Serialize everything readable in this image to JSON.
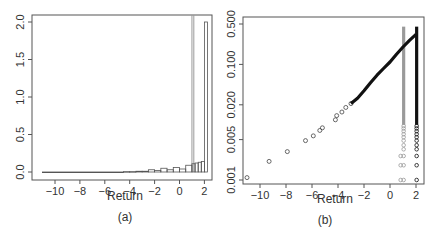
{
  "chart_data": [
    {
      "panel_label": "(a)",
      "type": "bar",
      "title": "",
      "xlabel": "Return",
      "ylabel": "",
      "xlim": [
        -11,
        2.5
      ],
      "ylim": [
        0,
        2.0
      ],
      "x_ticks": [
        -10,
        -8,
        -6,
        -4,
        -2,
        0,
        2
      ],
      "y_ticks": [
        "0.0",
        "0.5",
        "1.0",
        "1.5",
        "2.0"
      ],
      "y_tick_values": [
        0,
        0.5,
        1.0,
        1.5,
        2.0
      ],
      "grid": false,
      "histogram_bins": [
        {
          "x0": -11.0,
          "x1": -4.5,
          "density": 0.0
        },
        {
          "x0": -4.5,
          "x1": -4.0,
          "density": 0.005
        },
        {
          "x0": -4.0,
          "x1": -3.5,
          "density": 0.005
        },
        {
          "x0": -3.5,
          "x1": -3.0,
          "density": 0.01
        },
        {
          "x0": -3.0,
          "x1": -2.5,
          "density": 0.01
        },
        {
          "x0": -2.5,
          "x1": -2.0,
          "density": 0.03
        },
        {
          "x0": -2.0,
          "x1": -1.5,
          "density": 0.02
        },
        {
          "x0": -1.5,
          "x1": -1.0,
          "density": 0.05
        },
        {
          "x0": -1.0,
          "x1": -0.5,
          "density": 0.03
        },
        {
          "x0": -0.5,
          "x1": 0.0,
          "density": 0.06
        },
        {
          "x0": 0.0,
          "x1": 0.5,
          "density": 0.04
        },
        {
          "x0": 0.5,
          "x1": 1.0,
          "density": 0.09
        },
        {
          "x0": 1.0,
          "x1": 1.25,
          "density": 0.11
        },
        {
          "x0": 1.25,
          "x1": 1.5,
          "density": 0.12
        },
        {
          "x0": 1.5,
          "x1": 1.75,
          "density": 0.13
        },
        {
          "x0": 1.75,
          "x1": 2.0,
          "density": 0.14
        },
        {
          "x0": 2.0,
          "x1": 2.25,
          "density": 2.0
        }
      ],
      "gray_spikes_x": [
        1.0,
        1.15
      ]
    },
    {
      "panel_label": "(b)",
      "type": "scatter",
      "title": "",
      "xlabel": "Return",
      "ylabel": "",
      "y_scale": "log",
      "xlim": [
        -11,
        2.5
      ],
      "ylim": [
        0.001,
        0.5
      ],
      "x_ticks": [
        -10,
        -8,
        -6,
        -4,
        -2,
        0,
        2
      ],
      "y_ticks": [
        "0.001",
        "0.005",
        "0.020",
        "0.100",
        "0.500"
      ],
      "y_tick_values": [
        0.001,
        0.005,
        0.02,
        0.1,
        0.5
      ],
      "grid": false,
      "series": [
        {
          "name": "empirical tail (black)",
          "points": [
            {
              "x": -11.0,
              "y": 0.0011
            },
            {
              "x": -9.3,
              "y": 0.0021
            },
            {
              "x": -7.9,
              "y": 0.0031
            },
            {
              "x": -6.5,
              "y": 0.0048
            },
            {
              "x": -5.9,
              "y": 0.0058
            },
            {
              "x": -5.4,
              "y": 0.0072
            },
            {
              "x": -5.2,
              "y": 0.008
            },
            {
              "x": -4.2,
              "y": 0.011
            },
            {
              "x": -4.1,
              "y": 0.013
            },
            {
              "x": -3.7,
              "y": 0.015
            },
            {
              "x": -3.4,
              "y": 0.018
            },
            {
              "x": -3.0,
              "y": 0.021
            },
            {
              "x": -2.5,
              "y": 0.026
            },
            {
              "x": -2.0,
              "y": 0.035
            },
            {
              "x": -1.5,
              "y": 0.048
            },
            {
              "x": -1.0,
              "y": 0.065
            },
            {
              "x": -0.5,
              "y": 0.085
            },
            {
              "x": 0.0,
              "y": 0.11
            },
            {
              "x": 0.5,
              "y": 0.15
            },
            {
              "x": 1.0,
              "y": 0.2
            },
            {
              "x": 1.5,
              "y": 0.26
            },
            {
              "x": 2.0,
              "y": 0.33
            }
          ]
        },
        {
          "name": "point mass at ~2.0 (black column)",
          "x": 2.05,
          "y_range": [
            0.001,
            0.45
          ]
        },
        {
          "name": "point mass at ~1.1 (gray column)",
          "x": 1.05,
          "y_range": [
            0.001,
            0.45
          ]
        }
      ]
    }
  ],
  "panels": {
    "a": {
      "label": "(a)",
      "xlabel": "Return"
    },
    "b": {
      "label": "(b)",
      "xlabel": "Return"
    }
  },
  "colors": {
    "axis": "#555555",
    "bars": "#555555",
    "gray_series": "#9a9a9a",
    "black_series": "#111111",
    "background": "#ffffff"
  }
}
